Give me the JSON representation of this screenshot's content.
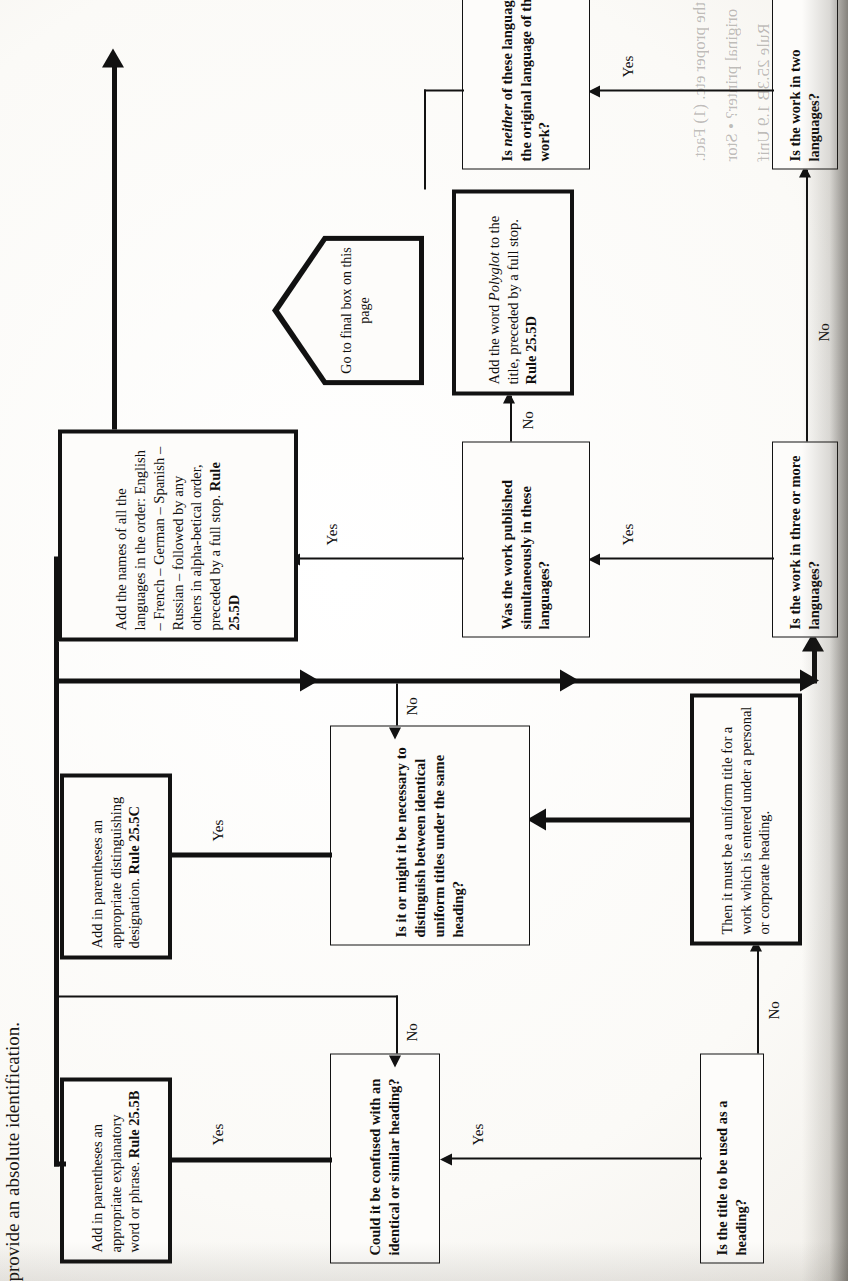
{
  "page": {
    "header_fragment": "provide an absolute identification.",
    "orientation": "rotated-90-ccw",
    "background_hex": "#fbfaf7",
    "ink_hex": "#121212"
  },
  "flowchart": {
    "type": "decision-flowchart",
    "title_fragment": "provide an absolute identification.",
    "nodes": [
      {
        "id": "q-title-heading",
        "kind": "decision",
        "bold": true,
        "weight": "thin",
        "text": "Is the title to be used as a heading?"
      },
      {
        "id": "q-confused",
        "kind": "decision",
        "bold": true,
        "weight": "thin",
        "text": "Could it be confused with an identical or similar heading?"
      },
      {
        "id": "a-explanatory",
        "kind": "action",
        "bold": false,
        "weight": "thick",
        "text": "Add in parentheses an appropriate explanatory word or phrase.",
        "rule": "Rule 25.5B"
      },
      {
        "id": "s-uniform-title",
        "kind": "statement",
        "bold": false,
        "weight": "thick",
        "text": "Then it must be a uniform title for a work which is entered under a personal or corporate heading."
      },
      {
        "id": "q-distinguish",
        "kind": "decision",
        "bold": true,
        "weight": "thin",
        "text": "Is it or might it be necessary to distinguish between identical uniform titles under the same heading?"
      },
      {
        "id": "a-distinguishing",
        "kind": "action",
        "bold": false,
        "weight": "thick",
        "text": "Add in parentheses an appropriate distinguishing designation.",
        "rule": "Rule 25.5C"
      },
      {
        "id": "q-three-or-more",
        "kind": "decision",
        "bold": true,
        "weight": "thin",
        "text": "Is the work in three or more languages?"
      },
      {
        "id": "q-simultaneous",
        "kind": "decision",
        "bold": true,
        "weight": "thin",
        "text": "Was the work published simultaneously in these languages?"
      },
      {
        "id": "a-languages-list",
        "kind": "action",
        "bold": false,
        "weight": "thick",
        "text": "Add the names of all the languages in the order: English – French – German – Spanish – Russian – followed by any others in alpha-betical order, preceded by a full stop.",
        "rule": "Rule 25.5D"
      },
      {
        "id": "a-polyglot",
        "kind": "action",
        "bold": false,
        "weight": "thick",
        "text": "Add the word Polyglot to the title, preceded by a full stop.",
        "text_italic_word": "Polyglot",
        "rule": "Rule 25.5D"
      },
      {
        "id": "q-two-languages",
        "kind": "decision",
        "bold": true,
        "weight": "thin",
        "text": "Is the work in two languages?"
      },
      {
        "id": "q-neither-original",
        "kind": "decision",
        "bold": true,
        "weight": "thin",
        "text": "Is neither of these languages the original language of the work?",
        "text_italic_word": "neither"
      },
      {
        "id": "goto-final-box",
        "kind": "connector-pentagon",
        "text": "Go to final box on this page"
      }
    ],
    "edge_labels": {
      "yes": "Yes",
      "no": "No"
    },
    "edges": [
      {
        "from": "q-title-heading",
        "to": "q-confused",
        "label": "Yes"
      },
      {
        "from": "q-title-heading",
        "to": "s-uniform-title",
        "label": "No"
      },
      {
        "from": "q-confused",
        "to": "a-explanatory",
        "label": "Yes"
      },
      {
        "from": "q-confused",
        "to": "main-return-bus",
        "label": "No"
      },
      {
        "from": "s-uniform-title",
        "to": "q-distinguish",
        "label": ""
      },
      {
        "from": "q-distinguish",
        "to": "a-distinguishing",
        "label": "Yes"
      },
      {
        "from": "q-distinguish",
        "to": "main-bus",
        "label": "No"
      },
      {
        "from": "q-three-or-more",
        "to": "q-simultaneous",
        "label": "Yes"
      },
      {
        "from": "q-three-or-more",
        "to": "q-two-languages",
        "label": "No"
      },
      {
        "from": "q-simultaneous",
        "to": "a-languages-list",
        "label": "Yes"
      },
      {
        "from": "q-simultaneous",
        "to": "a-polyglot",
        "label": "No"
      },
      {
        "from": "q-two-languages",
        "to": "q-neither-original",
        "label": "Yes"
      },
      {
        "from": "a-explanatory",
        "to": "top-bus",
        "label": ""
      },
      {
        "from": "a-distinguishing",
        "to": "top-bus",
        "label": ""
      },
      {
        "from": "a-languages-list",
        "to": "exit-right",
        "label": ""
      }
    ]
  },
  "ghost_text": {
    "lines": [
      "the proper etc. (1) Fact.",
      "original printer? • Stor",
      "Rule 25.3B        1.9 Unif"
    ]
  }
}
